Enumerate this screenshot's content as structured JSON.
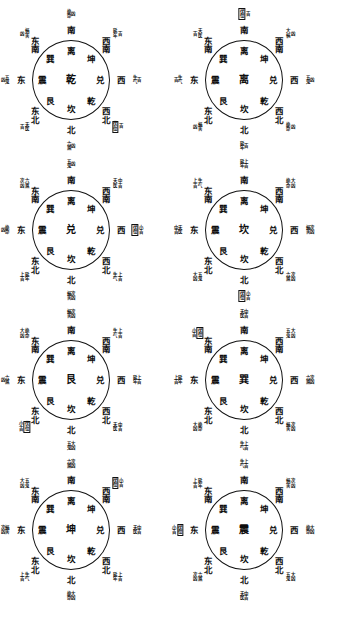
{
  "document": {
    "type": "feng-shui-bagua-chart-set",
    "title": "八宅游年变爻图",
    "diagram_count": 8,
    "columns": 2,
    "rows": 4
  },
  "legend": {
    "auspicious": "吉",
    "inauspicious": "凶",
    "slightly_auspicious": "小吉",
    "very_auspicious": "上吉",
    "moderately_auspicious": "中吉",
    "moderately_inauspicious": "次凶",
    "very_inauspicious": "大凶"
  },
  "trigram_ring": {
    "note": "Eight trigram glyphs printed inside every circle at fixed clock positions",
    "positions": [
      "N",
      "NE",
      "E",
      "SE",
      "S",
      "SW",
      "W",
      "NW"
    ],
    "glyphs": [
      "坎",
      "艮",
      "震",
      "巽",
      "离",
      "坤",
      "兑",
      "乾"
    ]
  },
  "direction_ring": {
    "note": "Eight direction names printed outside every circle",
    "glyphs": [
      "南",
      "西南",
      "西",
      "西北",
      "北",
      "东北",
      "东",
      "东南"
    ]
  },
  "diagrams": [
    {
      "index": 1,
      "center": "乾",
      "inner": {
        "n": "坎",
        "ne": "艮",
        "e": "震",
        "se": "巽",
        "s": "离",
        "sw": "坤",
        "w": "兑",
        "nw": "乾"
      },
      "outer": {
        "s": "南",
        "sw": "西南",
        "w": "西",
        "nw": "西北",
        "n": "北",
        "ne": "东北",
        "e": "东",
        "se": "东南"
      },
      "annotations": [
        {
          "dir": "s",
          "name": "绝命",
          "rating": "凶",
          "boxed": false
        },
        {
          "dir": "sw",
          "name": "延年",
          "rating": "吉",
          "boxed": false
        },
        {
          "dir": "w",
          "name": "生气",
          "rating": "吉",
          "boxed": false
        },
        {
          "dir": "nw",
          "name": "伏位",
          "rating": "吉",
          "boxed": true
        },
        {
          "dir": "n",
          "name": "六煞",
          "rating": "凶",
          "boxed": false
        },
        {
          "dir": "ne",
          "name": "天医",
          "rating": "吉",
          "boxed": false
        },
        {
          "dir": "e",
          "name": "五鬼",
          "rating": "凶",
          "boxed": false
        },
        {
          "dir": "se",
          "name": "祸害",
          "rating": "凶",
          "boxed": false
        }
      ]
    },
    {
      "index": 2,
      "center": "离",
      "inner": {
        "n": "坎",
        "ne": "艮",
        "e": "震",
        "se": "巽",
        "s": "离",
        "sw": "坤",
        "w": "兑",
        "nw": "乾"
      },
      "outer": {
        "s": "南",
        "sw": "西南",
        "w": "西",
        "nw": "西北",
        "n": "北",
        "ne": "东北",
        "e": "东",
        "se": "东南"
      },
      "annotations": [
        {
          "dir": "s",
          "name": "伏位",
          "rating": "吉",
          "boxed": true
        },
        {
          "dir": "sw",
          "name": "大祸",
          "rating": "凶",
          "boxed": false
        },
        {
          "dir": "w",
          "name": "五鬼",
          "rating": "凶",
          "boxed": false
        },
        {
          "dir": "nw",
          "name": "绝命",
          "rating": "凶",
          "boxed": false
        },
        {
          "dir": "n",
          "name": "延年",
          "rating": "吉",
          "boxed": false
        },
        {
          "dir": "ne",
          "name": "祸害",
          "rating": "凶",
          "boxed": false
        },
        {
          "dir": "e",
          "name": "生气",
          "rating": "吉",
          "boxed": false
        },
        {
          "dir": "se",
          "name": "天医",
          "rating": "吉",
          "boxed": false
        }
      ]
    },
    {
      "index": 3,
      "center": "兑",
      "inner": {
        "n": "坎",
        "ne": "艮",
        "e": "震",
        "se": "巽",
        "s": "离",
        "sw": "坤",
        "w": "兑",
        "nw": "乾"
      },
      "outer": {
        "s": "南",
        "sw": "西南",
        "w": "西",
        "nw": "西北",
        "n": "北",
        "ne": "东北",
        "e": "东",
        "se": "东南"
      },
      "annotations": [
        {
          "dir": "s",
          "name": "五鬼",
          "rating": "凶",
          "boxed": false
        },
        {
          "dir": "sw",
          "name": "天医",
          "rating": "中吉",
          "boxed": false
        },
        {
          "dir": "w",
          "name": "伏位",
          "rating": "小吉",
          "boxed": true
        },
        {
          "dir": "nw",
          "name": "生气",
          "rating": "上吉",
          "boxed": false
        },
        {
          "dir": "n",
          "name": "祸害",
          "rating": "次凶",
          "boxed": false
        },
        {
          "dir": "ne",
          "name": "延年",
          "rating": "上吉",
          "boxed": false
        },
        {
          "dir": "e",
          "name": "绝命",
          "rating": "凶",
          "boxed": false
        },
        {
          "dir": "se",
          "name": "六煞",
          "rating": "次凶",
          "boxed": false
        }
      ]
    },
    {
      "index": 4,
      "center": "坎",
      "inner": {
        "n": "坎",
        "ne": "艮",
        "e": "震",
        "se": "巽",
        "s": "离",
        "sw": "坤",
        "w": "兑",
        "nw": "乾"
      },
      "outer": {
        "s": "南",
        "sw": "西南",
        "w": "西",
        "nw": "西北",
        "n": "北",
        "ne": "东北",
        "e": "东",
        "se": "东南"
      },
      "annotations": [
        {
          "dir": "s",
          "name": "延年",
          "rating": "上吉",
          "boxed": false
        },
        {
          "dir": "sw",
          "name": "绝命",
          "rating": "大凶",
          "boxed": false
        },
        {
          "dir": "w",
          "name": "祸害",
          "rating": "次凶",
          "boxed": false
        },
        {
          "dir": "nw",
          "name": "六煞",
          "rating": "次凶",
          "boxed": false
        },
        {
          "dir": "n",
          "name": "伏位",
          "rating": "小吉",
          "boxed": true
        },
        {
          "dir": "ne",
          "name": "五鬼",
          "rating": "大凶",
          "boxed": false
        },
        {
          "dir": "e",
          "name": "天医",
          "rating": "中吉",
          "boxed": false
        },
        {
          "dir": "se",
          "name": "生气",
          "rating": "上吉",
          "boxed": false
        }
      ]
    },
    {
      "index": 5,
      "center": "艮",
      "inner": {
        "n": "坎",
        "ne": "艮",
        "e": "震",
        "se": "巽",
        "s": "离",
        "sw": "坤",
        "w": "兑",
        "nw": "乾"
      },
      "outer": {
        "s": "南",
        "sw": "西南",
        "w": "西",
        "nw": "西北",
        "n": "北",
        "ne": "东北",
        "e": "东",
        "se": "东南"
      },
      "annotations": [
        {
          "dir": "s",
          "name": "祸害",
          "rating": "次凶",
          "boxed": false
        },
        {
          "dir": "sw",
          "name": "生气",
          "rating": "上吉",
          "boxed": false
        },
        {
          "dir": "w",
          "name": "延年",
          "rating": "上吉",
          "boxed": false
        },
        {
          "dir": "nw",
          "name": "天医",
          "rating": "中吉",
          "boxed": false
        },
        {
          "dir": "n",
          "name": "五鬼",
          "rating": "大凶",
          "boxed": false
        },
        {
          "dir": "ne",
          "name": "伏位",
          "rating": "小吉",
          "boxed": true
        },
        {
          "dir": "e",
          "name": "六煞",
          "rating": "凶",
          "boxed": false
        },
        {
          "dir": "se",
          "name": "绝命",
          "rating": "大凶",
          "boxed": false
        }
      ]
    },
    {
      "index": 6,
      "center": "巽",
      "inner": {
        "n": "坎",
        "ne": "艮",
        "e": "震",
        "se": "巽",
        "s": "离",
        "sw": "坤",
        "w": "兑",
        "nw": "乾"
      },
      "outer": {
        "s": "南",
        "sw": "西南",
        "w": "西",
        "nw": "西北",
        "n": "北",
        "ne": "东北",
        "e": "东",
        "se": "东南"
      },
      "annotations": [
        {
          "dir": "s",
          "name": "天医",
          "rating": "中吉",
          "boxed": false
        },
        {
          "dir": "sw",
          "name": "五鬼",
          "rating": "大凶",
          "boxed": false
        },
        {
          "dir": "w",
          "name": "六煞",
          "rating": "次凶",
          "boxed": false
        },
        {
          "dir": "nw",
          "name": "祸害",
          "rating": "次凶",
          "boxed": false
        },
        {
          "dir": "n",
          "name": "生气",
          "rating": "上吉",
          "boxed": false
        },
        {
          "dir": "ne",
          "name": "绝命",
          "rating": "大凶",
          "boxed": false
        },
        {
          "dir": "e",
          "name": "延年",
          "rating": "上吉",
          "boxed": false
        },
        {
          "dir": "se",
          "name": "伏位",
          "rating": "小吉",
          "boxed": true
        }
      ]
    },
    {
      "index": 7,
      "center": "坤",
      "inner": {
        "n": "坎",
        "ne": "艮",
        "e": "震",
        "se": "巽",
        "s": "离",
        "sw": "坤",
        "w": "兑",
        "nw": "乾"
      },
      "outer": {
        "s": "南",
        "sw": "西南",
        "w": "西",
        "nw": "西北",
        "n": "北",
        "ne": "东北",
        "e": "东",
        "se": "东南"
      },
      "annotations": [
        {
          "dir": "s",
          "name": "六煞",
          "rating": "次凶",
          "boxed": false
        },
        {
          "dir": "sw",
          "name": "伏位",
          "rating": "小吉",
          "boxed": true
        },
        {
          "dir": "w",
          "name": "天医",
          "rating": "中吉",
          "boxed": false
        },
        {
          "dir": "nw",
          "name": "延年",
          "rating": "上吉",
          "boxed": false
        },
        {
          "dir": "n",
          "name": "绝命",
          "rating": "大凶",
          "boxed": false
        },
        {
          "dir": "ne",
          "name": "生气",
          "rating": "上吉",
          "boxed": false
        },
        {
          "dir": "e",
          "name": "祸害",
          "rating": "次凶",
          "boxed": false
        },
        {
          "dir": "se",
          "name": "五鬼",
          "rating": "大凶",
          "boxed": false
        }
      ]
    },
    {
      "index": 8,
      "center": "震",
      "inner": {
        "n": "坎",
        "ne": "艮",
        "e": "震",
        "se": "巽",
        "s": "离",
        "sw": "坤",
        "w": "兑",
        "nw": "乾"
      },
      "outer": {
        "s": "南",
        "sw": "西南",
        "w": "西",
        "nw": "西北",
        "n": "北",
        "ne": "东北",
        "e": "东",
        "se": "东南"
      },
      "annotations": [
        {
          "dir": "s",
          "name": "生气",
          "rating": "上吉",
          "boxed": false
        },
        {
          "dir": "sw",
          "name": "祸害",
          "rating": "次凶",
          "boxed": false
        },
        {
          "dir": "w",
          "name": "绝命",
          "rating": "大凶",
          "boxed": false
        },
        {
          "dir": "nw",
          "name": "五鬼",
          "rating": "大凶",
          "boxed": false
        },
        {
          "dir": "n",
          "name": "天医",
          "rating": "中吉",
          "boxed": false
        },
        {
          "dir": "ne",
          "name": "六煞",
          "rating": "次凶",
          "boxed": false
        },
        {
          "dir": "e",
          "name": "伏位",
          "rating": "小吉",
          "boxed": true
        },
        {
          "dir": "se",
          "name": "延年",
          "rating": "上吉",
          "boxed": false
        }
      ]
    }
  ]
}
